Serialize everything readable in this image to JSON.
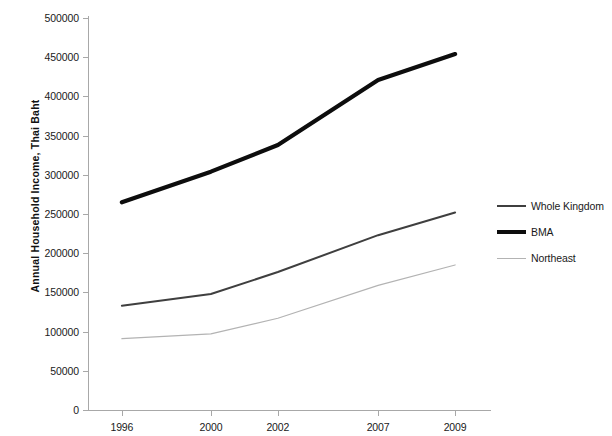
{
  "chart_data": {
    "type": "line",
    "title": "",
    "xlabel": "",
    "ylabel": "Annual Household Income, Thai Baht",
    "categories": [
      "1996",
      "2000",
      "2002",
      "2007",
      "2009"
    ],
    "ylim": [
      0,
      500000
    ],
    "ytick_step": 50000,
    "yticks": [
      0,
      50000,
      100000,
      150000,
      200000,
      250000,
      300000,
      350000,
      400000,
      450000,
      500000
    ],
    "ytick_labels": [
      "0",
      "50000",
      "100000",
      "150000",
      "200000",
      "250000",
      "300000",
      "350000",
      "400000",
      "450000",
      "500000"
    ],
    "grid": false,
    "legend_position": "right",
    "series": [
      {
        "name": "Whole Kingdom",
        "color": "#3f3f3f",
        "width": 2.0,
        "values": [
          133000,
          148000,
          176000,
          223000,
          252000
        ]
      },
      {
        "name": "BMA",
        "color": "#0d0d0d",
        "width": 4.2,
        "values": [
          265000,
          304000,
          338000,
          421000,
          454000
        ]
      },
      {
        "name": "Northeast",
        "color": "#b3b3b3",
        "width": 1.2,
        "values": [
          91000,
          97000,
          117000,
          159000,
          185000
        ]
      }
    ]
  },
  "axis": {
    "y_title": "Annual Household Income, Thai Baht",
    "axis_color": "#a8a8a8"
  },
  "legend": {
    "entries": [
      {
        "label": "Whole Kingdom"
      },
      {
        "label": "BMA"
      },
      {
        "label": "Northeast"
      }
    ]
  }
}
